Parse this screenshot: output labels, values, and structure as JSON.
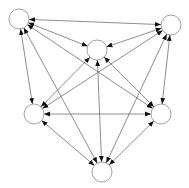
{
  "diagram": {
    "type": "directed-graph",
    "nodes": [
      {
        "id": "top-left",
        "label": ""
      },
      {
        "id": "top-right",
        "label": ""
      },
      {
        "id": "center",
        "label": ""
      },
      {
        "id": "middle-left",
        "label": ""
      },
      {
        "id": "middle-right",
        "label": ""
      },
      {
        "id": "bottom",
        "label": ""
      }
    ],
    "edges": [
      {
        "from": "top-left",
        "to": "top-right",
        "direction": "both"
      },
      {
        "from": "top-left",
        "to": "center",
        "direction": "both"
      },
      {
        "from": "top-left",
        "to": "middle-left",
        "direction": "both"
      },
      {
        "from": "top-left",
        "to": "middle-right",
        "direction": "both"
      },
      {
        "from": "top-left",
        "to": "bottom",
        "direction": "both"
      },
      {
        "from": "top-right",
        "to": "center",
        "direction": "both"
      },
      {
        "from": "top-right",
        "to": "middle-left",
        "direction": "both"
      },
      {
        "from": "top-right",
        "to": "middle-right",
        "direction": "both"
      },
      {
        "from": "top-right",
        "to": "bottom",
        "direction": "both"
      },
      {
        "from": "center",
        "to": "middle-left",
        "direction": "both"
      },
      {
        "from": "center",
        "to": "middle-right",
        "direction": "both"
      },
      {
        "from": "center",
        "to": "bottom",
        "direction": "both"
      },
      {
        "from": "middle-left",
        "to": "middle-right",
        "direction": "both"
      },
      {
        "from": "middle-left",
        "to": "bottom",
        "direction": "both"
      },
      {
        "from": "middle-right",
        "to": "bottom",
        "direction": "both"
      }
    ],
    "colors": {
      "edge": "#707070",
      "arrowhead": "#111111",
      "node_stroke": "#8a8a8a",
      "node_fill": "#ffffff"
    }
  }
}
